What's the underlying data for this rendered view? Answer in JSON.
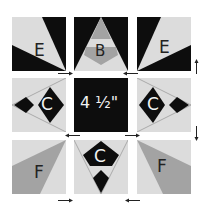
{
  "colors": {
    "dark": "#0d0d0d",
    "light": "#dcdcdc",
    "medium": "#a3a3a3",
    "white": "#ffffff",
    "label_dark": "#222222",
    "label_light": "#f2f2f2"
  },
  "blocks": [
    {
      "id": "top-left",
      "label": "E"
    },
    {
      "id": "top-center",
      "label": "B"
    },
    {
      "id": "top-right",
      "label": "E"
    },
    {
      "id": "middle-left",
      "label": "C"
    },
    {
      "id": "center",
      "label": "4 ½\""
    },
    {
      "id": "middle-right",
      "label": "C"
    },
    {
      "id": "bottom-left",
      "label": "F"
    },
    {
      "id": "bottom-center",
      "label": "C"
    },
    {
      "id": "bottom-right",
      "label": "F"
    }
  ],
  "arrows": [
    {
      "id": "row1-right",
      "direction": "right"
    },
    {
      "id": "row1-left",
      "direction": "left"
    },
    {
      "id": "right-top-up",
      "direction": "up"
    },
    {
      "id": "row2-left",
      "direction": "left"
    },
    {
      "id": "row2-right",
      "direction": "right"
    },
    {
      "id": "right-bottom-down",
      "direction": "down"
    },
    {
      "id": "row3-right",
      "direction": "right"
    },
    {
      "id": "row3-left",
      "direction": "left"
    }
  ]
}
